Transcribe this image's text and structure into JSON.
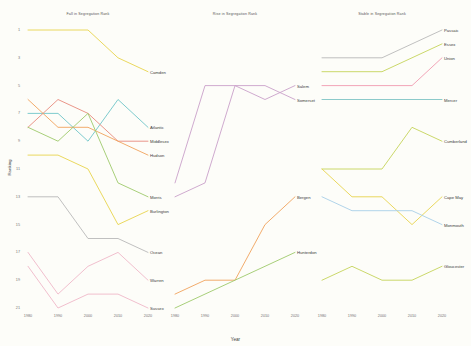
{
  "figure": {
    "x_axis_title": "Year",
    "y_axis_title": "Ranking",
    "x_ticks": [
      "1980",
      "1990",
      "2000",
      "2010",
      "2020"
    ],
    "y_ticks": [
      "1",
      "3",
      "5",
      "7",
      "9",
      "11",
      "13",
      "15",
      "17",
      "19",
      "21"
    ],
    "background": "#fdfdf9"
  },
  "chart_data": {
    "type": "line",
    "xlabel": "Year",
    "ylabel": "Ranking",
    "x": [
      1980,
      1990,
      2000,
      2010,
      2020
    ],
    "xlim": [
      1980,
      2020
    ],
    "ylim": [
      1,
      21
    ],
    "y_inverted": true,
    "grid": false,
    "legend": "direct-labels-at-line-end",
    "panels": [
      {
        "title": "Fall in Segregation Rank",
        "series": [
          {
            "name": "Camden",
            "color": "#e8d44d",
            "values": [
              1,
              1,
              1,
              3,
              4
            ]
          },
          {
            "name": "Atlantic",
            "color": "#6fc5c8",
            "values": [
              7,
              7,
              9,
              6,
              8
            ]
          },
          {
            "name": "Middlesex",
            "color": "#e88a7d",
            "values": [
              8,
              6,
              7,
              9,
              9
            ]
          },
          {
            "name": "Hudson",
            "color": "#f0a35c",
            "values": [
              6,
              8,
              8,
              9,
              10
            ]
          },
          {
            "name": "Morris",
            "color": "#9ec96b",
            "values": [
              8,
              9,
              7,
              12,
              13
            ]
          },
          {
            "name": "Burlington",
            "color": "#e8d44d",
            "values": [
              10,
              10,
              11,
              15,
              14
            ]
          },
          {
            "name": "Ocean",
            "color": "#b9b9b9",
            "values": [
              13,
              13,
              16,
              16,
              17
            ]
          },
          {
            "name": "Warren",
            "color": "#efb8c8",
            "values": [
              17,
              20,
              18,
              17,
              19
            ]
          },
          {
            "name": "Sussex",
            "color": "#efb8c8",
            "values": [
              18,
              21,
              20,
              20,
              21
            ]
          }
        ]
      },
      {
        "title": "Rise in Segregation Rank",
        "series": [
          {
            "name": "Salem",
            "color": "#c9a0c9",
            "values": [
              12,
              5,
              5,
              6,
              5
            ]
          },
          {
            "name": "Somerset",
            "color": "#c9a0c9",
            "values": [
              13,
              12,
              5,
              5,
              6
            ]
          },
          {
            "name": "Bergen",
            "color": "#f0a35c",
            "values": [
              20,
              19,
              19,
              15,
              13
            ]
          },
          {
            "name": "Hunterdon",
            "color": "#9ec96b",
            "values": [
              21,
              20,
              19,
              18,
              17
            ]
          }
        ]
      },
      {
        "title": "Stable in Segregation Rank",
        "series": [
          {
            "name": "Passaic",
            "color": "#b9b9b9",
            "values": [
              3,
              3,
              3,
              2,
              1
            ]
          },
          {
            "name": "Essex",
            "color": "#c5d45a",
            "values": [
              4,
              4,
              4,
              3,
              2
            ]
          },
          {
            "name": "Union",
            "color": "#f09bb0",
            "values": [
              5,
              5,
              5,
              5,
              3
            ]
          },
          {
            "name": "Mercer",
            "color": "#7fc4c4",
            "values": [
              6,
              6,
              6,
              6,
              6
            ]
          },
          {
            "name": "Cumberland",
            "color": "#c5d45a",
            "values": [
              11,
              11,
              11,
              8,
              9
            ]
          },
          {
            "name": "Cape May",
            "color": "#e8d44d",
            "values": [
              11,
              13,
              13,
              15,
              13
            ]
          },
          {
            "name": "Monmouth",
            "color": "#a8cfe8",
            "values": [
              13,
              14,
              14,
              14,
              15
            ]
          },
          {
            "name": "Gloucester",
            "color": "#c5d45a",
            "values": [
              19,
              18,
              19,
              19,
              18
            ]
          }
        ]
      }
    ]
  }
}
